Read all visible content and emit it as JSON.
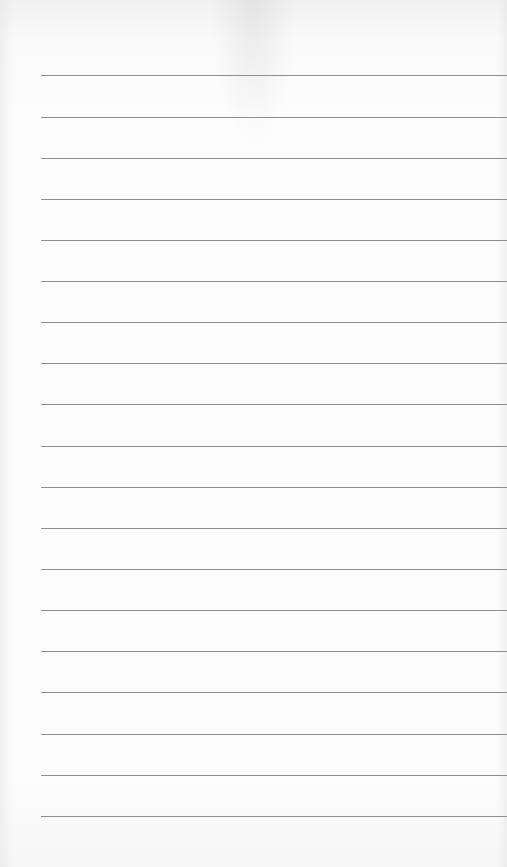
{
  "notepad": {
    "background_color": "#fbfbfb",
    "rule_color": "#8e8e8e",
    "rule_left": 41,
    "lines": [
      {
        "y": 75,
        "text": ""
      },
      {
        "y": 117,
        "text": ""
      },
      {
        "y": 158,
        "text": ""
      },
      {
        "y": 199,
        "text": ""
      },
      {
        "y": 240,
        "text": ""
      },
      {
        "y": 281,
        "text": ""
      },
      {
        "y": 322,
        "text": ""
      },
      {
        "y": 363,
        "text": ""
      },
      {
        "y": 404,
        "text": ""
      },
      {
        "y": 446,
        "text": ""
      },
      {
        "y": 487,
        "text": ""
      },
      {
        "y": 528,
        "text": ""
      },
      {
        "y": 569,
        "text": ""
      },
      {
        "y": 610,
        "text": ""
      },
      {
        "y": 651,
        "text": ""
      },
      {
        "y": 692,
        "text": ""
      },
      {
        "y": 734,
        "text": ""
      },
      {
        "y": 775,
        "text": ""
      },
      {
        "y": 816,
        "text": ""
      }
    ]
  }
}
